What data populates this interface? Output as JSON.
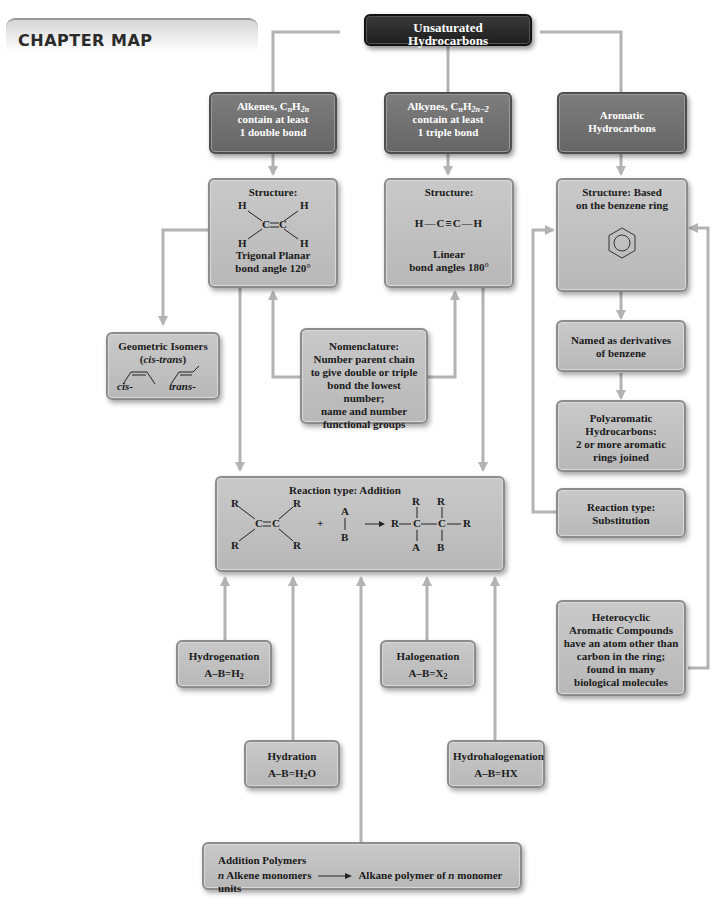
{
  "header": {
    "title": "CHAPTER MAP"
  },
  "root": {
    "label": "Unsaturated Hydrocarbons"
  },
  "categories": {
    "alkenes": {
      "line1": "Alkenes, C",
      "n": "n",
      "h": "H",
      "sub2n": "2n",
      "line2": "contain at least",
      "line3": "1 double bond"
    },
    "alkynes": {
      "line1": "Alkynes, C",
      "n": "n",
      "h": "H",
      "sub2n": "2n−2",
      "line2": "contain at least",
      "line3": "1 triple bond"
    },
    "aromatic": {
      "line1": "Aromatic",
      "line2": "Hydrocarbons"
    }
  },
  "structures": {
    "alkene": {
      "title": "Structure:",
      "atoms": {
        "h": "H",
        "c": "C"
      },
      "line1": "Trigonal Planar",
      "line2": "bond angle 120°"
    },
    "alkyne": {
      "title": "Structure:",
      "formula": "H—C≡C—H",
      "line1": "Linear",
      "line2": "bond angles 180°"
    },
    "aromatic": {
      "line1": "Structure: Based",
      "line2": "on the benzene ring",
      "icon": "benzene-ring-icon"
    }
  },
  "geometric_isomers": {
    "title": "Geometric Isomers",
    "subtitle_open": "(",
    "subtitle_italic": "cis-trans",
    "subtitle_close": ")",
    "cis_label": "cis-",
    "trans_label": "trans-"
  },
  "nomenclature": {
    "lines": [
      "Nomenclature:",
      "Number parent chain",
      "to give double or triple",
      "bond the lowest number;",
      "name and number",
      "functional groups"
    ]
  },
  "aromatic_chain": {
    "named": {
      "lines": [
        "Named as derivatives",
        "of benzene"
      ]
    },
    "polyaromatic": {
      "lines": [
        "Polyaromatic",
        "Hydrocarbons:",
        "2 or more aromatic",
        "rings joined"
      ]
    },
    "substitution": {
      "lines": [
        "Reaction type:",
        "Substitution"
      ]
    },
    "heterocyclic": {
      "lines": [
        "Heterocyclic",
        "Aromatic Compounds",
        "have an atom other than",
        "carbon in the ring;",
        "found in many",
        "biological molecules"
      ]
    }
  },
  "addition": {
    "title": "Reaction type: Addition",
    "atoms": {
      "r": "R",
      "c": "C",
      "a": "A",
      "b": "B"
    },
    "plus": "+"
  },
  "reactions": {
    "hydrogenation": {
      "name": "Hydrogenation",
      "eq": "A–B=H",
      "sub": "2",
      "tail": ""
    },
    "halogenation": {
      "name": "Halogenation",
      "eq": "A–B=X",
      "sub": "2",
      "tail": ""
    },
    "hydration": {
      "name": "Hydration",
      "eq": "A–B=H",
      "sub": "2",
      "tail": "O"
    },
    "hydrohalogenation": {
      "name": "Hydrohalogenation",
      "eq": "A–B=HX",
      "sub": "",
      "tail": ""
    }
  },
  "polymers": {
    "title": "Addition Polymers",
    "n": "n",
    "left": " Alkene monomers",
    "right_pre": "Alkane polymer of ",
    "right_n": "n",
    "right_post": " monomer units"
  },
  "colors": {
    "root_box": "#262626",
    "category_box": "#727272",
    "content_box": "#bfbfbf",
    "connector": "#b3b3b3"
  }
}
